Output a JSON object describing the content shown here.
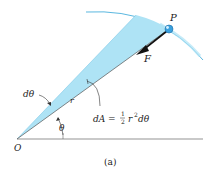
{
  "figure": {
    "caption": "(a)",
    "colors": {
      "wedge_fill": "#aee3f5",
      "arc": "#5bb8e0",
      "line": "#555555",
      "vector": "#111111",
      "particle": "#3aa0dd"
    },
    "labels": {
      "point_P": "P",
      "force_F": "F",
      "origin_O": "O",
      "radius_r": "r",
      "angle_theta": "θ",
      "angle_dtheta": "dθ",
      "area_formula_lhs": "dA = ",
      "area_formula_num": "1",
      "area_formula_den": "2",
      "area_formula_rhs_r": "r",
      "area_formula_rhs_exp": "2",
      "area_formula_rhs_tail": "dθ"
    }
  }
}
